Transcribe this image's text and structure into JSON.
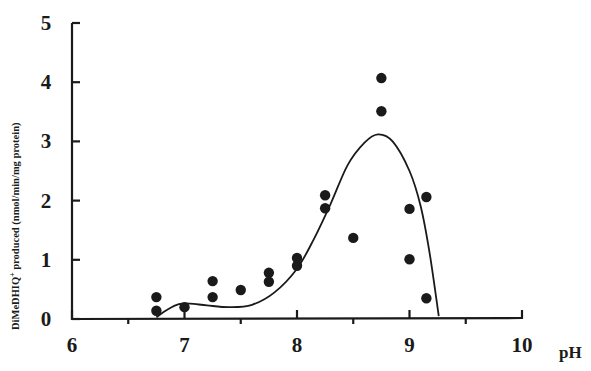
{
  "chart_data": {
    "type": "scatter",
    "title": "",
    "xlabel": "pH",
    "ylabel": "DiMeDHIQ⁺ produced (nmol/min/mg protein)",
    "xlim": [
      6,
      10
    ],
    "ylim": [
      0,
      5
    ],
    "x_ticks": [
      6,
      7,
      8,
      9,
      10
    ],
    "x_minor_ticks": [
      6.5,
      7.5,
      8.5,
      9.5
    ],
    "y_ticks": [
      0,
      1,
      2,
      3,
      4,
      5
    ],
    "grid": false,
    "legend": null,
    "series": [
      {
        "name": "measured",
        "type": "scatter",
        "marker": "filled-circle",
        "points": [
          {
            "x": 6.75,
            "y": 0.37
          },
          {
            "x": 6.75,
            "y": 0.14
          },
          {
            "x": 7.0,
            "y": 0.2
          },
          {
            "x": 7.25,
            "y": 0.64
          },
          {
            "x": 7.25,
            "y": 0.37
          },
          {
            "x": 7.5,
            "y": 0.49
          },
          {
            "x": 7.75,
            "y": 0.78
          },
          {
            "x": 7.75,
            "y": 0.63
          },
          {
            "x": 8.0,
            "y": 1.03
          },
          {
            "x": 8.0,
            "y": 0.9
          },
          {
            "x": 8.25,
            "y": 2.09
          },
          {
            "x": 8.25,
            "y": 1.87
          },
          {
            "x": 8.5,
            "y": 1.37
          },
          {
            "x": 8.75,
            "y": 4.07
          },
          {
            "x": 8.75,
            "y": 3.51
          },
          {
            "x": 9.0,
            "y": 1.86
          },
          {
            "x": 9.0,
            "y": 1.01
          },
          {
            "x": 9.15,
            "y": 2.06
          },
          {
            "x": 9.15,
            "y": 0.35
          }
        ]
      },
      {
        "name": "fitted curve",
        "type": "line",
        "smooth": true,
        "points": [
          {
            "x": 6.75,
            "y": 0.03
          },
          {
            "x": 6.85,
            "y": 0.16
          },
          {
            "x": 6.95,
            "y": 0.25
          },
          {
            "x": 7.05,
            "y": 0.26
          },
          {
            "x": 7.2,
            "y": 0.23
          },
          {
            "x": 7.4,
            "y": 0.2
          },
          {
            "x": 7.6,
            "y": 0.24
          },
          {
            "x": 7.8,
            "y": 0.45
          },
          {
            "x": 8.0,
            "y": 0.85
          },
          {
            "x": 8.15,
            "y": 1.35
          },
          {
            "x": 8.3,
            "y": 1.95
          },
          {
            "x": 8.45,
            "y": 2.6
          },
          {
            "x": 8.6,
            "y": 2.98
          },
          {
            "x": 8.72,
            "y": 3.12
          },
          {
            "x": 8.85,
            "y": 3.0
          },
          {
            "x": 9.0,
            "y": 2.5
          },
          {
            "x": 9.1,
            "y": 1.9
          },
          {
            "x": 9.18,
            "y": 1.1
          },
          {
            "x": 9.26,
            "y": 0.05
          }
        ]
      }
    ]
  },
  "axes": {
    "x_label": "pH",
    "y_label_main": "DiMeDHIQ",
    "y_label_sup": "+",
    "y_label_rest": " produced (nmol/min/mg protein)"
  },
  "colors": {
    "ink": "#1a1a1a",
    "background": "#ffffff"
  }
}
